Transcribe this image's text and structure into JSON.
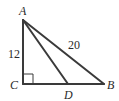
{
  "diagram": {
    "type": "right-triangle",
    "vertices": {
      "A": "A",
      "B": "B",
      "C": "C",
      "D": "D"
    },
    "segments": [
      {
        "from": "A",
        "to": "C",
        "label": "12"
      },
      {
        "from": "A",
        "to": "B",
        "label": "20"
      },
      {
        "from": "C",
        "to": "B",
        "label": ""
      },
      {
        "from": "A",
        "to": "D",
        "label": ""
      }
    ],
    "right_angle_at": "C",
    "labels": {
      "AC": "12",
      "AB": "20"
    }
  }
}
